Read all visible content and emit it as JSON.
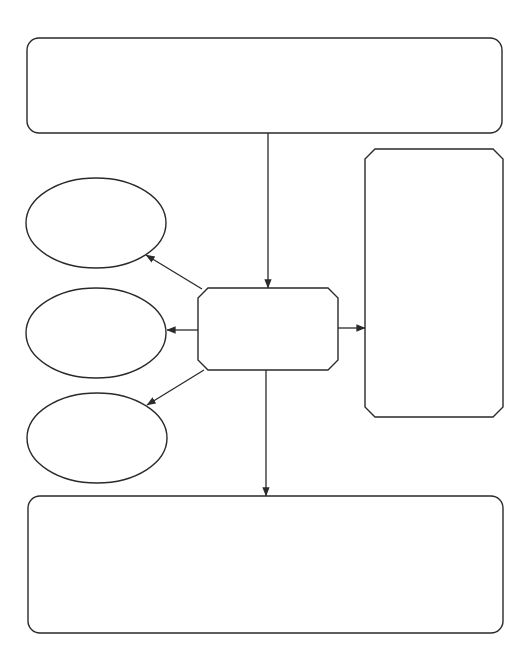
{
  "diagram": {
    "type": "graphic-organizer",
    "stroke_color": "#2a2a2a",
    "background": "#ffffff",
    "nodes": [
      {
        "id": "top-box",
        "shape": "rounded-rect",
        "x": 27,
        "y": 38,
        "w": 475,
        "h": 95,
        "r": 12,
        "label": ""
      },
      {
        "id": "center-box",
        "shape": "chamfered-rect",
        "x": 198,
        "y": 288,
        "w": 140,
        "h": 82,
        "c": 10,
        "label": ""
      },
      {
        "id": "right-box",
        "shape": "chamfered-rect",
        "x": 365,
        "y": 149,
        "w": 138,
        "h": 268,
        "c": 10,
        "label": ""
      },
      {
        "id": "ellipse-1",
        "shape": "ellipse",
        "cx": 96,
        "cy": 223,
        "rx": 70,
        "ry": 45,
        "label": ""
      },
      {
        "id": "ellipse-2",
        "shape": "ellipse",
        "cx": 96,
        "cy": 333,
        "rx": 70,
        "ry": 45,
        "label": ""
      },
      {
        "id": "ellipse-3",
        "shape": "ellipse",
        "cx": 97,
        "cy": 438,
        "rx": 70,
        "ry": 45,
        "label": ""
      },
      {
        "id": "bottom-box",
        "shape": "rounded-rect",
        "x": 28,
        "y": 496,
        "w": 475,
        "h": 137,
        "r": 12,
        "label": ""
      }
    ],
    "edges": [
      {
        "id": "top-to-center",
        "from": "top-box",
        "to": "center-box",
        "x1": 268,
        "y1": 133,
        "x2": 268,
        "y2": 288
      },
      {
        "id": "center-to-ellipse-1",
        "from": "center-box",
        "to": "ellipse-1",
        "x1": 202,
        "y1": 289,
        "x2": 146,
        "y2": 255
      },
      {
        "id": "center-to-ellipse-2",
        "from": "center-box",
        "to": "ellipse-2",
        "x1": 198,
        "y1": 330,
        "x2": 167,
        "y2": 330
      },
      {
        "id": "center-to-ellipse-3",
        "from": "center-box",
        "to": "ellipse-3",
        "x1": 204,
        "y1": 370,
        "x2": 147,
        "y2": 405
      },
      {
        "id": "center-to-right",
        "from": "center-box",
        "to": "right-box",
        "x1": 338,
        "y1": 328,
        "x2": 365,
        "y2": 328
      },
      {
        "id": "center-to-bottom",
        "from": "center-box",
        "to": "bottom-box",
        "x1": 266,
        "y1": 370,
        "x2": 266,
        "y2": 496
      }
    ]
  }
}
